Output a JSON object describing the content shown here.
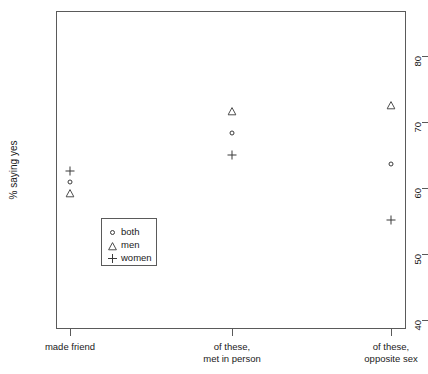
{
  "chart_data": {
    "type": "scatter",
    "title": "",
    "xlabel": "",
    "ylabel": "% saying yes",
    "categories": [
      "made friend",
      "of these,\nmet in person",
      "of these,\nopposite sex"
    ],
    "x": [
      1,
      2,
      3
    ],
    "ylim": [
      37,
      85
    ],
    "yticks": [
      40,
      50,
      60,
      70,
      80
    ],
    "ytick_labels": [
      "40",
      "50",
      "60",
      "70",
      "80"
    ],
    "grid": false,
    "legend_position": "center-left-inside",
    "series": [
      {
        "name": "both",
        "marker": "circle",
        "values": [
          60.9,
          68.4,
          63.7
        ]
      },
      {
        "name": "men",
        "marker": "triangle",
        "values": [
          59.2,
          71.7,
          72.6
        ]
      },
      {
        "name": "women",
        "marker": "plus",
        "values": [
          62.6,
          65.0,
          55.2
        ]
      }
    ]
  },
  "axes": {
    "y_title": "% saying yes",
    "y_ticks": [
      {
        "label": "80",
        "value": 80
      },
      {
        "label": "70",
        "value": 70
      },
      {
        "label": "60",
        "value": 60
      },
      {
        "label": "50",
        "value": 50
      },
      {
        "label": "40",
        "value": 40
      }
    ],
    "x_ticks": [
      {
        "line1": "made friend",
        "line2": ""
      },
      {
        "line1": "of these,",
        "line2": "met in person"
      },
      {
        "line1": "of these,",
        "line2": "opposite sex"
      }
    ]
  },
  "legend": {
    "items": [
      {
        "label": "both",
        "symbol": "circle-marker"
      },
      {
        "label": "men",
        "symbol": "triangle-marker"
      },
      {
        "label": "women",
        "symbol": "plus-marker"
      }
    ]
  },
  "colors": {
    "axis": "#5a5a5a",
    "marker": "#3a3a3a",
    "text": "#1a1a1a",
    "background": "#ffffff"
  }
}
